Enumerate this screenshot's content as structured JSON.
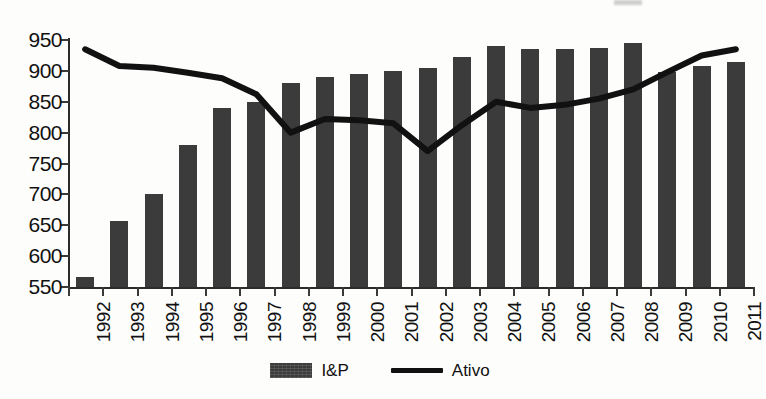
{
  "chart_data": {
    "type": "bar",
    "title": "",
    "subtitle": "",
    "xlabel": "",
    "ylabel": "",
    "ylim": [
      550,
      950
    ],
    "ytick_step": 50,
    "yticks": [
      950,
      900,
      850,
      800,
      750,
      700,
      650,
      600,
      550
    ],
    "grid": false,
    "legend_position": "bottom",
    "categories": [
      "1992",
      "1993",
      "1994",
      "1995",
      "1996",
      "1997",
      "1998",
      "1999",
      "2000",
      "2001",
      "2002",
      "2003",
      "2004",
      "2005",
      "2006",
      "2007",
      "2008",
      "2009",
      "2010",
      "2011"
    ],
    "series": [
      {
        "name": "I&P",
        "type": "bar",
        "color": "#3b3b3b",
        "values": [
          567,
          657,
          700,
          780,
          840,
          850,
          880,
          890,
          895,
          900,
          905,
          922,
          940,
          935,
          935,
          937,
          945,
          898,
          908,
          915
        ]
      },
      {
        "name": "Ativo",
        "type": "line",
        "color": "#111111",
        "values": [
          935,
          908,
          905,
          897,
          888,
          862,
          800,
          822,
          820,
          815,
          770,
          812,
          850,
          840,
          845,
          855,
          870,
          898,
          925,
          935
        ]
      }
    ]
  },
  "legend": {
    "items": [
      {
        "label": "I&P",
        "marker": "bar-swatch"
      },
      {
        "label": "Ativo",
        "marker": "line-swatch"
      }
    ]
  }
}
